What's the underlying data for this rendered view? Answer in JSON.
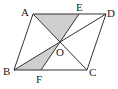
{
  "figure": {
    "type": "parallelogram-diagram",
    "shape": "parallelogram ABCD",
    "colors": {
      "stroke": "#333333",
      "shade": "#cfcfcf",
      "background": "#ffffff",
      "label": "#222222"
    },
    "points": {
      "A": {
        "label": "A",
        "x": 33,
        "y": 14
      },
      "D": {
        "label": "D",
        "x": 106,
        "y": 14
      },
      "B": {
        "label": "B",
        "x": 14,
        "y": 70
      },
      "C": {
        "label": "C",
        "x": 87,
        "y": 70
      },
      "O": {
        "label": "O",
        "x": 60,
        "y": 42
      },
      "E": {
        "label": "E",
        "x": 79,
        "y": 14
      },
      "F": {
        "label": "F",
        "x": 41,
        "y": 70
      }
    },
    "segments": [
      "AD",
      "DC",
      "CB",
      "BA",
      "AC",
      "BD",
      "EF"
    ],
    "shaded_regions": [
      "triangle AEO",
      "triangle BFO"
    ]
  }
}
